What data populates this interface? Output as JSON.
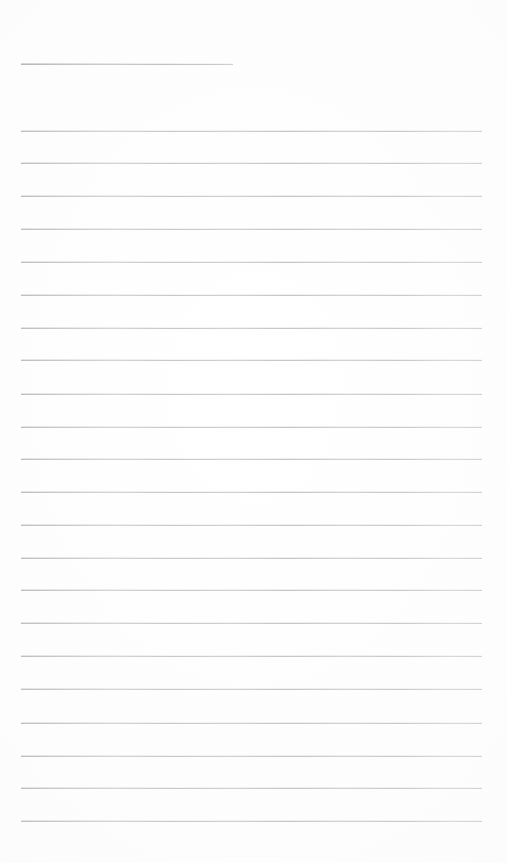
{
  "page": {
    "kind": "ruled-notebook-page",
    "width_px": 507,
    "height_px": 863,
    "background_color": "#ffffff",
    "content_text": "",
    "is_blank": true
  },
  "rules": {
    "line_color": "#c9ccd1",
    "line_thickness_px": 1,
    "left_margin_px": 21,
    "right_edge_px": 482,
    "line_spacing_px": 32.85,
    "first_body_line_y_px": 131,
    "last_body_line_y_px": 821,
    "bottom_margin_px": 42,
    "header_rule": {
      "label": "header-underline",
      "y_px": 64,
      "x_start_px": 21,
      "x_end_px": 233,
      "length_px": 212
    },
    "body_lines": [
      {
        "index": 1,
        "y_px": 131
      },
      {
        "index": 2,
        "y_px": 163
      },
      {
        "index": 3,
        "y_px": 196
      },
      {
        "index": 4,
        "y_px": 229
      },
      {
        "index": 5,
        "y_px": 262
      },
      {
        "index": 6,
        "y_px": 295
      },
      {
        "index": 7,
        "y_px": 328
      },
      {
        "index": 8,
        "y_px": 360
      },
      {
        "index": 9,
        "y_px": 394
      },
      {
        "index": 10,
        "y_px": 427
      },
      {
        "index": 11,
        "y_px": 459
      },
      {
        "index": 12,
        "y_px": 492
      },
      {
        "index": 13,
        "y_px": 525
      },
      {
        "index": 14,
        "y_px": 558
      },
      {
        "index": 15,
        "y_px": 590
      },
      {
        "index": 16,
        "y_px": 623
      },
      {
        "index": 17,
        "y_px": 656
      },
      {
        "index": 18,
        "y_px": 689
      },
      {
        "index": 19,
        "y_px": 723
      },
      {
        "index": 20,
        "y_px": 756
      },
      {
        "index": 21,
        "y_px": 788
      },
      {
        "index": 22,
        "y_px": 821
      }
    ]
  }
}
